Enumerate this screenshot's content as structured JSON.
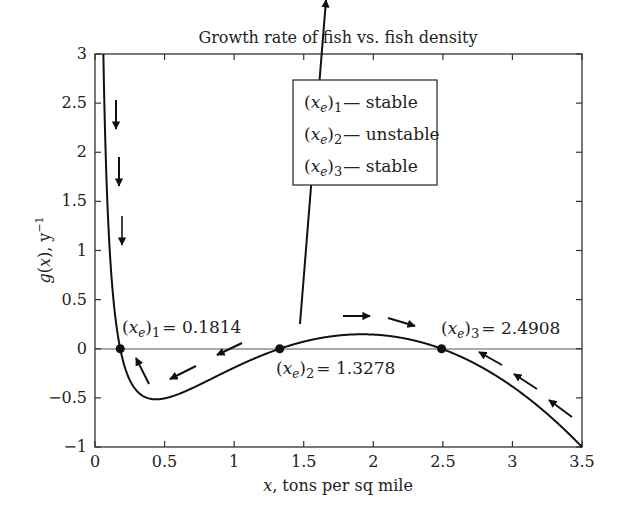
{
  "chart_data": {
    "type": "line",
    "title": "Growth rate of fish vs. fish density",
    "xlabel": "x, tons per sq mile",
    "ylabel": "g(x), y^-1",
    "xlim": [
      0,
      3.5
    ],
    "ylim": [
      -1,
      3
    ],
    "xticks": [
      0,
      0.5,
      1,
      1.5,
      2,
      2.5,
      3,
      3.5
    ],
    "yticks": [
      -1,
      -0.5,
      0,
      0.5,
      1,
      1.5,
      2,
      2.5,
      3
    ],
    "xtick_labels": [
      "0",
      "0.5",
      "1",
      "1.5",
      "2",
      "2.5",
      "3",
      "3.5"
    ],
    "ytick_labels": [
      "−1",
      "−0.5",
      "0",
      "0.5",
      "1",
      "1.5",
      "2",
      "2.5",
      "3"
    ],
    "grid": false,
    "series": [
      {
        "name": "g(x)",
        "x": [
          0.06,
          0.08,
          0.1,
          0.13,
          0.1814,
          0.25,
          0.35,
          0.45,
          0.6,
          0.8,
          1.0,
          1.2,
          1.3278,
          1.5,
          1.7,
          1.9,
          2.1,
          2.3,
          2.4908,
          2.7,
          2.9,
          3.1,
          3.3,
          3.5
        ],
        "y": [
          2.95,
          1.95,
          1.36,
          0.76,
          0.0,
          -0.37,
          -0.5,
          -0.51,
          -0.45,
          -0.33,
          -0.2,
          -0.07,
          0.0,
          0.07,
          0.13,
          0.15,
          0.13,
          0.08,
          0.0,
          -0.13,
          -0.3,
          -0.5,
          -0.73,
          -1.0
        ]
      }
    ],
    "equilibria": [
      {
        "label": "(x_e)_1",
        "value": 0.1814,
        "stability": "stable"
      },
      {
        "label": "(x_e)_2",
        "value": 1.3278,
        "stability": "unstable"
      },
      {
        "label": "(x_e)_3",
        "value": 2.4908,
        "stability": "stable"
      }
    ],
    "annotations": [
      "(x_e)_1 = 0.1814",
      "(x_e)_2 = 1.3278",
      "(x_e)_3 = 2.4908"
    ],
    "legend": {
      "position": "upper-right",
      "entries": [
        "(x_e)_1 — stable",
        "(x_e)_2 — unstable",
        "(x_e)_3 — stable"
      ]
    }
  },
  "labels": {
    "title": "Growth rate of fish vs. fish density",
    "xlabel_var": "x",
    "xlabel_rest": ", tons per sq mile",
    "ylabel_g": "g",
    "ylabel_x": "x",
    "ylabel_unit": "y",
    "ylabel_exp": "−1",
    "eq1_value": "= 0.1814",
    "eq2_value": "= 1.3278",
    "eq3_value": "= 2.4908",
    "sub1": "1",
    "sub2": "2",
    "sub3": "3",
    "legend1": "— stable",
    "legend2": "— unstable",
    "legend3": "— stable"
  }
}
